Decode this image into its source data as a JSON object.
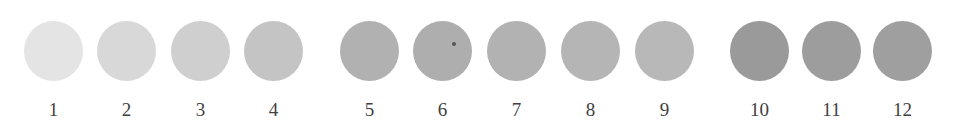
{
  "swatches": [
    {
      "label": "1",
      "color": "#e4e4e4",
      "x": 24
    },
    {
      "label": "2",
      "color": "#d8d8d8",
      "x": 97
    },
    {
      "label": "3",
      "color": "#cfcfcf",
      "x": 171
    },
    {
      "label": "4",
      "color": "#c4c4c4",
      "x": 244
    },
    {
      "label": "5",
      "color": "#b1b1b1",
      "x": 340
    },
    {
      "label": "6",
      "color": "#aeaeae",
      "x": 413
    },
    {
      "label": "7",
      "color": "#b2b2b2",
      "x": 487
    },
    {
      "label": "8",
      "color": "#b5b5b5",
      "x": 561
    },
    {
      "label": "9",
      "color": "#b8b8b8",
      "x": 635
    },
    {
      "label": "10",
      "color": "#9a9a9a",
      "x": 730
    },
    {
      "label": "11",
      "color": "#9d9d9d",
      "x": 802
    },
    {
      "label": "12",
      "color": "#9f9f9f",
      "x": 873
    }
  ]
}
